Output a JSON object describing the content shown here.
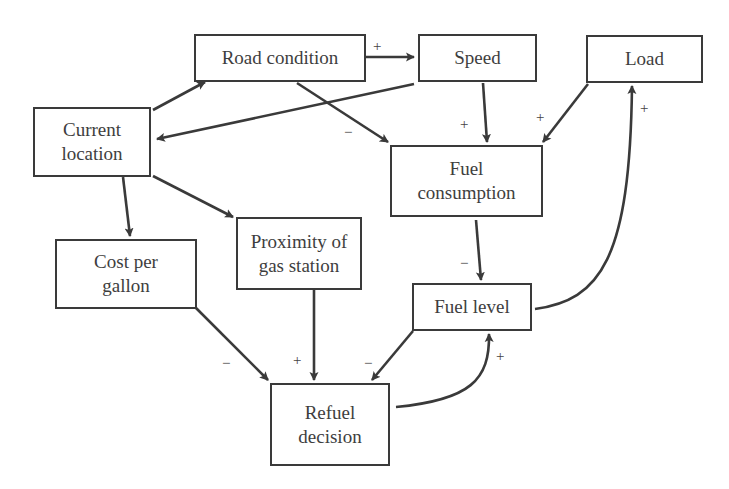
{
  "diagram": {
    "type": "causal-loop",
    "nodes": [
      {
        "id": "road_condition",
        "label": "Road condition"
      },
      {
        "id": "speed",
        "label": "Speed"
      },
      {
        "id": "load",
        "label": "Load"
      },
      {
        "id": "current_location",
        "label": "Current\nlocation"
      },
      {
        "id": "fuel_consumption",
        "label": "Fuel\nconsumption"
      },
      {
        "id": "cost_per_gallon",
        "label": "Cost per\ngallon"
      },
      {
        "id": "proximity_gas_station",
        "label": "Proximity of\ngas station"
      },
      {
        "id": "fuel_level",
        "label": "Fuel level"
      },
      {
        "id": "refuel_decision",
        "label": "Refuel\ndecision"
      }
    ],
    "edges": [
      {
        "from": "road_condition",
        "to": "speed",
        "sign": "+"
      },
      {
        "from": "current_location",
        "to": "road_condition",
        "sign": ""
      },
      {
        "from": "speed",
        "to": "current_location",
        "sign": ""
      },
      {
        "from": "road_condition",
        "to": "fuel_consumption",
        "sign": "−"
      },
      {
        "from": "speed",
        "to": "fuel_consumption",
        "sign": "+"
      },
      {
        "from": "load",
        "to": "fuel_consumption",
        "sign": "+"
      },
      {
        "from": "current_location",
        "to": "cost_per_gallon",
        "sign": ""
      },
      {
        "from": "current_location",
        "to": "proximity_gas_station",
        "sign": ""
      },
      {
        "from": "fuel_consumption",
        "to": "fuel_level",
        "sign": "−"
      },
      {
        "from": "fuel_level",
        "to": "load",
        "sign": "+"
      },
      {
        "from": "cost_per_gallon",
        "to": "refuel_decision",
        "sign": "−"
      },
      {
        "from": "proximity_gas_station",
        "to": "refuel_decision",
        "sign": "+"
      },
      {
        "from": "fuel_level",
        "to": "refuel_decision",
        "sign": "−"
      },
      {
        "from": "refuel_decision",
        "to": "fuel_level",
        "sign": "+"
      }
    ]
  },
  "signs": {
    "road_speed": "+",
    "road_fuelcons": "−",
    "speed_fuelcons": "+",
    "load_fuelcons": "+",
    "fuellevel_load": "+",
    "fuelcons_fuellevel": "−",
    "cost_refuel": "−",
    "prox_refuel": "+",
    "fuellevel_refuel": "−",
    "refuel_fuellevel": "+"
  },
  "colors": {
    "stroke": "#3a3a3a",
    "text": "#3e3e3e",
    "background": "#ffffff"
  }
}
